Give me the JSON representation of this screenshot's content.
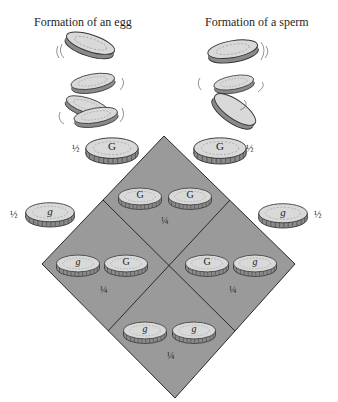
{
  "titles": {
    "egg": "Formation of an egg",
    "sperm": "Formation of a sperm"
  },
  "colors": {
    "square_fill": "#9a9a9a",
    "square_line": "#2a2a2a",
    "coin_face": "#d9d9d9",
    "coin_edge": "#8a8a8a",
    "coin_outline": "#333333",
    "background": "#ffffff"
  },
  "egg_gametes": [
    {
      "allele": "G",
      "probability": "½"
    },
    {
      "allele": "g",
      "probability": "½"
    }
  ],
  "sperm_gametes": [
    {
      "allele": "G",
      "probability": "½"
    },
    {
      "allele": "g",
      "probability": "½"
    }
  ],
  "punnett_cells": [
    {
      "position": "top",
      "alleles": [
        "G",
        "G"
      ],
      "probability": "¼"
    },
    {
      "position": "left",
      "alleles": [
        "g",
        "G"
      ],
      "probability": "¼"
    },
    {
      "position": "right",
      "alleles": [
        "G",
        "g"
      ],
      "probability": "¼"
    },
    {
      "position": "bottom",
      "alleles": [
        "g",
        "g"
      ],
      "probability": "¼"
    }
  ]
}
